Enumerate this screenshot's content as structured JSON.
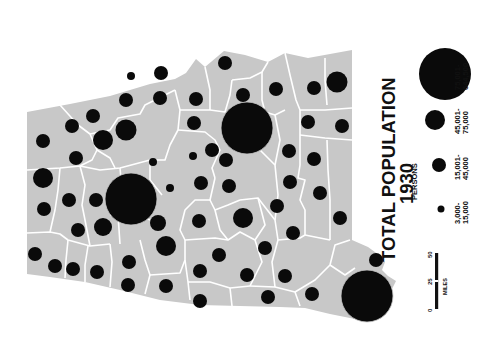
{
  "title": {
    "line1": "TOTAL POPULATION",
    "line2": "1930"
  },
  "legend": {
    "heading": "PERSONS",
    "classes": [
      {
        "range_line1": "3,000-",
        "range_line2": "15,000",
        "radius": 4
      },
      {
        "range_line1": "15,001-",
        "range_line2": "45,000",
        "radius": 7
      },
      {
        "range_line1": "45,001-",
        "range_line2": "75,000",
        "radius": 10.5
      },
      {
        "range_line1": "75,001-",
        "range_line2": "644,500",
        "radius": 26
      }
    ]
  },
  "scale_bar": {
    "ticks": [
      "0",
      "25",
      "50"
    ],
    "unit": "MILES"
  },
  "colors": {
    "land": "#c8c8c8",
    "boundary": "#ffffff",
    "symbol": "#0a0a0a",
    "background": "#ffffff"
  },
  "map": {
    "orientation": "rotated 90 degrees counter-clockwise",
    "dots": [
      {
        "x": 131,
        "y": 199,
        "r": 26
      },
      {
        "x": 247,
        "y": 128,
        "r": 26
      },
      {
        "x": 367,
        "y": 296,
        "r": 26
      },
      {
        "x": 337,
        "y": 82,
        "r": 10.5
      },
      {
        "x": 126,
        "y": 130,
        "r": 10.5
      },
      {
        "x": 103,
        "y": 140,
        "r": 10
      },
      {
        "x": 43,
        "y": 178,
        "r": 10
      },
      {
        "x": 166,
        "y": 246,
        "r": 10
      },
      {
        "x": 243,
        "y": 218,
        "r": 10
      },
      {
        "x": 103,
        "y": 227,
        "r": 9
      },
      {
        "x": 158,
        "y": 223,
        "r": 8
      },
      {
        "x": 93,
        "y": 116,
        "r": 7
      },
      {
        "x": 126,
        "y": 100,
        "r": 7
      },
      {
        "x": 72,
        "y": 126,
        "r": 7
      },
      {
        "x": 43,
        "y": 141,
        "r": 7
      },
      {
        "x": 76,
        "y": 158,
        "r": 7
      },
      {
        "x": 44,
        "y": 209,
        "r": 7
      },
      {
        "x": 69,
        "y": 200,
        "r": 7
      },
      {
        "x": 96,
        "y": 200,
        "r": 7
      },
      {
        "x": 78,
        "y": 230,
        "r": 7
      },
      {
        "x": 35,
        "y": 254,
        "r": 7
      },
      {
        "x": 55,
        "y": 266,
        "r": 7
      },
      {
        "x": 73,
        "y": 269,
        "r": 7
      },
      {
        "x": 97,
        "y": 272,
        "r": 7
      },
      {
        "x": 129,
        "y": 262,
        "r": 7
      },
      {
        "x": 128,
        "y": 285,
        "r": 7
      },
      {
        "x": 166,
        "y": 286,
        "r": 7
      },
      {
        "x": 200,
        "y": 271,
        "r": 7
      },
      {
        "x": 200,
        "y": 301,
        "r": 7
      },
      {
        "x": 219,
        "y": 255,
        "r": 7
      },
      {
        "x": 229,
        "y": 186,
        "r": 7
      },
      {
        "x": 201,
        "y": 183,
        "r": 7
      },
      {
        "x": 226,
        "y": 160,
        "r": 7
      },
      {
        "x": 161,
        "y": 73,
        "r": 7
      },
      {
        "x": 160,
        "y": 98,
        "r": 7
      },
      {
        "x": 194,
        "y": 123,
        "r": 7
      },
      {
        "x": 196,
        "y": 99,
        "r": 7
      },
      {
        "x": 225,
        "y": 63,
        "r": 7
      },
      {
        "x": 243,
        "y": 95,
        "r": 7
      },
      {
        "x": 265,
        "y": 248,
        "r": 7
      },
      {
        "x": 247,
        "y": 275,
        "r": 7
      },
      {
        "x": 268,
        "y": 297,
        "r": 7
      },
      {
        "x": 293,
        "y": 233,
        "r": 7
      },
      {
        "x": 285,
        "y": 276,
        "r": 7
      },
      {
        "x": 312,
        "y": 294,
        "r": 7
      },
      {
        "x": 320,
        "y": 193,
        "r": 7
      },
      {
        "x": 340,
        "y": 218,
        "r": 7
      },
      {
        "x": 314,
        "y": 159,
        "r": 7
      },
      {
        "x": 308,
        "y": 122,
        "r": 7
      },
      {
        "x": 314,
        "y": 88,
        "r": 7
      },
      {
        "x": 289,
        "y": 151,
        "r": 7
      },
      {
        "x": 290,
        "y": 182,
        "r": 7
      },
      {
        "x": 276,
        "y": 89,
        "r": 7
      },
      {
        "x": 199,
        "y": 221,
        "r": 7
      },
      {
        "x": 212,
        "y": 150,
        "r": 7
      },
      {
        "x": 342,
        "y": 126,
        "r": 7
      },
      {
        "x": 376,
        "y": 260,
        "r": 7
      },
      {
        "x": 170,
        "y": 188,
        "r": 4
      },
      {
        "x": 153,
        "y": 162,
        "r": 4
      },
      {
        "x": 131,
        "y": 76,
        "r": 4
      },
      {
        "x": 193,
        "y": 156,
        "r": 4
      },
      {
        "x": 277,
        "y": 206,
        "r": 7
      }
    ]
  }
}
